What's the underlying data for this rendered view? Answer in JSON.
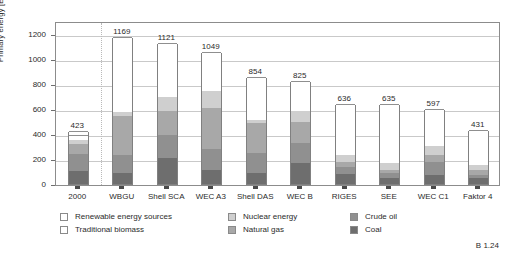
{
  "figure": {
    "code": "B 1.24"
  },
  "chart_data": {
    "type": "bar",
    "subtype": "stacked-bar",
    "title": "",
    "xlabel": "",
    "ylabel": "Primary energy [EJ/a]",
    "ylim": [
      0,
      1300
    ],
    "yticks": [
      0,
      200,
      400,
      600,
      800,
      1000,
      1200
    ],
    "ytick_labels": [
      "0",
      "200",
      "400",
      "600",
      "800",
      "1000",
      "1200"
    ],
    "grid": true,
    "legend_position": "below-axes",
    "categories": [
      "2000",
      "WBGU",
      "Shell SCA",
      "WEC A3",
      "Shell DAS",
      "WEC B",
      "RIGES",
      "SEE",
      "WEC C1",
      "Faktor 4"
    ],
    "totals": [
      423,
      1169,
      1121,
      1049,
      854,
      825,
      636,
      635,
      597,
      431
    ],
    "total_labels": [
      "423",
      "1169",
      "1121",
      "1049",
      "854",
      "825",
      "636",
      "635",
      "597",
      "431"
    ],
    "series": [
      {
        "name": "Coal",
        "color": "#6e6e6e",
        "values": [
          100,
          88,
          210,
          108,
          90,
          170,
          78,
          45,
          70,
          45
        ]
      },
      {
        "name": "Crude oil",
        "color": "#909090",
        "values": [
          140,
          140,
          180,
          175,
          160,
          155,
          55,
          45,
          105,
          30
        ]
      },
      {
        "name": "Natural gas",
        "color": "#a8a8a8",
        "values": [
          80,
          315,
          195,
          320,
          240,
          170,
          40,
          25,
          60,
          40
        ]
      },
      {
        "name": "Nuclear energy",
        "color": "#cfcfcf",
        "values": [
          30,
          35,
          110,
          140,
          22,
          85,
          55,
          50,
          70,
          40
        ]
      },
      {
        "name": "Traditional biomass",
        "color": "#ffffff",
        "values": [
          38,
          0,
          0,
          0,
          0,
          0,
          0,
          0,
          0,
          0
        ]
      },
      {
        "name": "Renewable energy sources",
        "color": "#ffffff",
        "values": [
          35,
          591,
          426,
          306,
          342,
          245,
          408,
          470,
          292,
          276
        ]
      }
    ],
    "annotations": {
      "separator_after_category": "2000"
    },
    "legend": [
      {
        "label": "Renewable energy sources",
        "color": "#ffffff"
      },
      {
        "label": "Traditional biomass",
        "color": "#ffffff"
      },
      {
        "label": "Nuclear energy",
        "color": "#cfcfcf"
      },
      {
        "label": "Natural gas",
        "color": "#a8a8a8"
      },
      {
        "label": "Crude oil",
        "color": "#909090"
      },
      {
        "label": "Coal",
        "color": "#6e6e6e"
      }
    ]
  }
}
